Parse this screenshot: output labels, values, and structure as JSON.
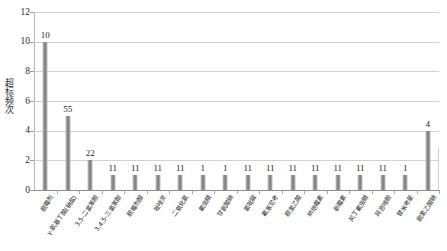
{
  "chart_data": {
    "type": "bar",
    "title": "",
    "xlabel": "",
    "ylabel": "超标频次",
    "ylim": [
      0,
      12
    ],
    "yticks": [
      0,
      2,
      4,
      6,
      8,
      10,
      12
    ],
    "grid": true,
    "legend": "none",
    "categories": [
      "脱霉剂",
      "γ-氨基丁酸(钠盐)",
      "3,5-二氯苯胺",
      "3,4,5-三氯苯酚",
      "脱霉剂醇",
      "吡唑灵",
      "二氧化氯",
      "氟虫腈",
      "甘氨酸钠",
      "氯吡脲",
      "氟苯尼考",
      "脱氢乙酸",
      "纳他霉素",
      "新霉素",
      "风丁氟虫腈",
      "异恶唑胺",
      "替米考星",
      "脱氢乙酸钠"
    ],
    "values": [
      10,
      5,
      2,
      1,
      1,
      1,
      1,
      1,
      1,
      1,
      1,
      1,
      1,
      1,
      1,
      1,
      1,
      4
    ],
    "data_labels": [
      "10",
      "55",
      "22",
      "11",
      "11",
      "11",
      "11",
      "1",
      "1",
      "11",
      "11",
      "11",
      "11",
      "11",
      "11",
      "11",
      "1",
      "4"
    ],
    "bar_color": "#8d8d8d",
    "grid_color": "#d2d2d2",
    "axis_color": "#8f8f8f"
  }
}
